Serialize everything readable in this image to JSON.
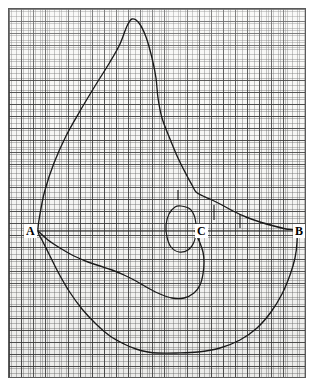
{
  "figure": {
    "background_color": "#ffffff",
    "paper_color": "#f7f7f5",
    "frame_color": "#5a5a5a",
    "curve_color": "#1a1a1a",
    "grid": {
      "fine_spacing_px": 2.38,
      "major_spacing_px": 11.9,
      "fine_color": "#696969",
      "major_color": "#3c3c3c",
      "visible": true
    }
  },
  "labels": {
    "a": "A",
    "b": "B",
    "c": "C"
  },
  "chart_data": {
    "type": "line",
    "xlabel": "",
    "ylabel": "",
    "grid": true,
    "legend": "none",
    "xlim": [
      8,
      306
    ],
    "ylim": [
      378,
      8
    ],
    "annotations": [
      {
        "name": "A",
        "text": "A",
        "x": 38,
        "y": 231
      },
      {
        "name": "C",
        "text": "C",
        "x": 200,
        "y": 231
      },
      {
        "name": "B",
        "text": "B",
        "x": 296,
        "y": 231
      }
    ],
    "series": [
      {
        "name": "outer-contour",
        "closed": true,
        "points": [
          [
            38,
            231
          ],
          [
            40,
            214
          ],
          [
            45,
            190
          ],
          [
            54,
            163
          ],
          [
            66,
            136
          ],
          [
            80,
            111
          ],
          [
            95,
            86
          ],
          [
            110,
            62
          ],
          [
            120,
            44
          ],
          [
            127,
            26
          ],
          [
            132,
            19
          ],
          [
            139,
            23
          ],
          [
            146,
            37
          ],
          [
            152,
            58
          ],
          [
            156,
            78
          ],
          [
            158,
            98
          ],
          [
            162,
            118
          ],
          [
            170,
            139
          ],
          [
            178,
            158
          ],
          [
            186,
            174
          ],
          [
            192,
            185
          ],
          [
            196,
            192
          ],
          [
            203,
            196
          ],
          [
            212,
            200
          ],
          [
            222,
            205
          ],
          [
            233,
            211
          ],
          [
            246,
            217
          ],
          [
            260,
            222
          ],
          [
            274,
            226
          ],
          [
            286,
            229
          ],
          [
            296,
            231
          ],
          [
            297,
            242
          ],
          [
            295,
            258
          ],
          [
            290,
            275
          ],
          [
            282,
            294
          ],
          [
            271,
            312
          ],
          [
            257,
            328
          ],
          [
            240,
            340
          ],
          [
            220,
            348
          ],
          [
            198,
            352
          ],
          [
            176,
            353
          ],
          [
            158,
            353
          ],
          [
            148,
            352
          ],
          [
            136,
            349
          ],
          [
            124,
            344
          ],
          [
            110,
            336
          ],
          [
            96,
            324
          ],
          [
            82,
            309
          ],
          [
            69,
            291
          ],
          [
            58,
            272
          ],
          [
            49,
            254
          ],
          [
            42,
            240
          ],
          [
            38,
            231
          ]
        ]
      },
      {
        "name": "inner-lower-ridge",
        "closed": false,
        "points": [
          [
            38,
            231
          ],
          [
            48,
            240
          ],
          [
            60,
            248
          ],
          [
            74,
            256
          ],
          [
            88,
            262
          ],
          [
            100,
            266
          ],
          [
            112,
            270
          ],
          [
            124,
            275
          ],
          [
            136,
            281
          ],
          [
            148,
            288
          ],
          [
            160,
            294
          ],
          [
            172,
            298
          ],
          [
            184,
            298
          ],
          [
            194,
            293
          ],
          [
            200,
            285
          ],
          [
            203,
            274
          ],
          [
            204,
            262
          ],
          [
            203,
            252
          ],
          [
            200,
            243
          ],
          [
            197,
            236
          ],
          [
            195,
            231
          ]
        ]
      },
      {
        "name": "small-oval",
        "closed": true,
        "points": [
          [
            181,
            206
          ],
          [
            190,
            209
          ],
          [
            195,
            218
          ],
          [
            196,
            230
          ],
          [
            194,
            242
          ],
          [
            188,
            250
          ],
          [
            179,
            252
          ],
          [
            171,
            247
          ],
          [
            167,
            237
          ],
          [
            166,
            225
          ],
          [
            169,
            214
          ],
          [
            175,
            207
          ],
          [
            181,
            206
          ]
        ]
      }
    ],
    "axis_line": {
      "name": "A-B baseline",
      "from": [
        38,
        231
      ],
      "to": [
        296,
        231
      ],
      "style": "solid"
    },
    "tick_marks": [
      {
        "name": "tick-1",
        "x": 214,
        "y_top": 205,
        "y_bottom": 220
      },
      {
        "name": "tick-2",
        "x": 240,
        "y_top": 214,
        "y_bottom": 228
      },
      {
        "name": "tick-3",
        "x": 178,
        "y_top": 190,
        "y_bottom": 200
      }
    ]
  }
}
